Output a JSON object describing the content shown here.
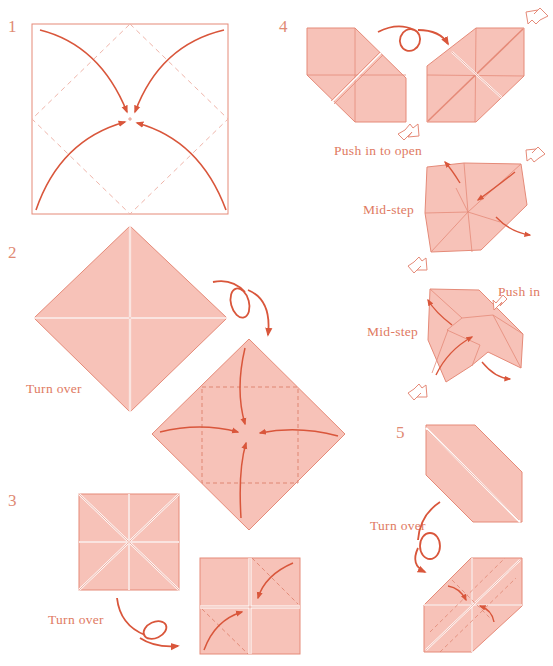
{
  "colors": {
    "paper_fill": "#f7c2b8",
    "paper_stroke": "#e58a78",
    "arrow": "#d9563b",
    "dashed": "#e89a8c",
    "label_text": "#e07a62"
  },
  "steps": [
    {
      "number": "1",
      "captions": []
    },
    {
      "number": "2",
      "captions": [
        "Turn over"
      ]
    },
    {
      "number": "3",
      "captions": [
        "Turn over"
      ]
    },
    {
      "number": "4",
      "captions": [
        "Push in to open",
        "Mid-step",
        "Mid-step",
        "Push in"
      ]
    },
    {
      "number": "5",
      "captions": [
        "Turn over"
      ]
    }
  ],
  "labels": {
    "step1": "1",
    "step2": "2",
    "step3": "3",
    "step4": "4",
    "step5": "5",
    "turn_over_2": "Turn over",
    "turn_over_3": "Turn over",
    "turn_over_5": "Turn over",
    "push_in_to_open": "Push in to open",
    "mid_step_1": "Mid-step",
    "mid_step_2": "Mid-step",
    "push_in": "Push in"
  }
}
